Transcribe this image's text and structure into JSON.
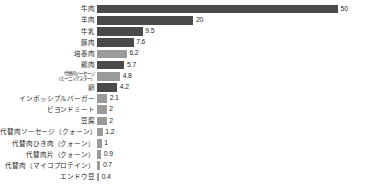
{
  "chart_data": {
    "type": "bar",
    "orientation": "horizontal",
    "title": "",
    "subtitle": "",
    "xlabel": "",
    "ylabel": "",
    "grid": false,
    "legend": null,
    "xlim": [
      0,
      50
    ],
    "categories": [
      "牛肉",
      "羊肉",
      "牛乳",
      "豚肉",
      "培養肉",
      "鶏肉",
      "代替肉ソーセージ\n（モーニングスター）",
      "卵",
      "インポッシブルバーガー",
      "ビヨンドミート",
      "豆腐",
      "代替肉ソーセージ（クォーン）",
      "代替肉ひき肉（クォーン）",
      "代替肉片（クォーン）",
      "代替肉（マイコプロテイン）",
      "エンドウ豆"
    ],
    "values": [
      50,
      20,
      9.5,
      7.6,
      6.2,
      5.7,
      4.8,
      4.2,
      2.1,
      2,
      2,
      1.2,
      1,
      0.9,
      0.7,
      0.4
    ],
    "value_labels": [
      "50",
      "20",
      "9.5",
      "7.6",
      "6.2",
      "5.7",
      "4.8",
      "4.2",
      "2.1",
      "2",
      "2",
      "1.2",
      "1",
      "0.9",
      "0.7",
      "0.4"
    ],
    "bar_shades": [
      "dark",
      "dark",
      "dark",
      "dark",
      "light",
      "dark",
      "light",
      "dark",
      "light",
      "light",
      "light",
      "light",
      "light",
      "light",
      "light",
      "light"
    ],
    "colors": {
      "bar_dark": "#4a4a4a",
      "bar_light": "#9a9a9a",
      "text": "#1f1f1f",
      "background": "#ffffff"
    }
  },
  "rows": [
    {
      "label": "牛肉",
      "label2": "",
      "value_label": "50",
      "width_pct": 100,
      "shade": "dark"
    },
    {
      "label": "羊肉",
      "label2": "",
      "value_label": "20",
      "width_pct": 40.0,
      "shade": "dark"
    },
    {
      "label": "牛乳",
      "label2": "",
      "value_label": "9.5",
      "width_pct": 19.0,
      "shade": "dark"
    },
    {
      "label": "豚肉",
      "label2": "",
      "value_label": "7.6",
      "width_pct": 15.2,
      "shade": "dark"
    },
    {
      "label": "培養肉",
      "label2": "",
      "value_label": "6.2",
      "width_pct": 12.4,
      "shade": "light"
    },
    {
      "label": "鶏肉",
      "label2": "",
      "value_label": "5.7",
      "width_pct": 11.4,
      "shade": "dark"
    },
    {
      "label": "代替肉ソーセージ",
      "label2": "（モーニングスター）",
      "value_label": "4.8",
      "width_pct": 9.6,
      "shade": "light"
    },
    {
      "label": "卵",
      "label2": "",
      "value_label": "4.2",
      "width_pct": 8.4,
      "shade": "dark"
    },
    {
      "label": "インポッシブルバーガー",
      "label2": "",
      "value_label": "2.1",
      "width_pct": 4.2,
      "shade": "light"
    },
    {
      "label": "ビヨンドミート",
      "label2": "",
      "value_label": "2",
      "width_pct": 4.0,
      "shade": "light"
    },
    {
      "label": "豆腐",
      "label2": "",
      "value_label": "2",
      "width_pct": 4.0,
      "shade": "light"
    },
    {
      "label": "代替肉ソーセージ（クォーン）",
      "label2": "",
      "value_label": "1.2",
      "width_pct": 2.4,
      "shade": "light"
    },
    {
      "label": "代替肉ひき肉（クォーン）",
      "label2": "",
      "value_label": "1",
      "width_pct": 2.0,
      "shade": "light"
    },
    {
      "label": "代替肉片（クォーン）",
      "label2": "",
      "value_label": "0.9",
      "width_pct": 1.8,
      "shade": "light"
    },
    {
      "label": "代替肉（マイコプロテイン）",
      "label2": "",
      "value_label": "0.7",
      "width_pct": 1.4,
      "shade": "light"
    },
    {
      "label": "エンドウ豆",
      "label2": "",
      "value_label": "0.4",
      "width_pct": 0.9,
      "shade": "light"
    }
  ]
}
